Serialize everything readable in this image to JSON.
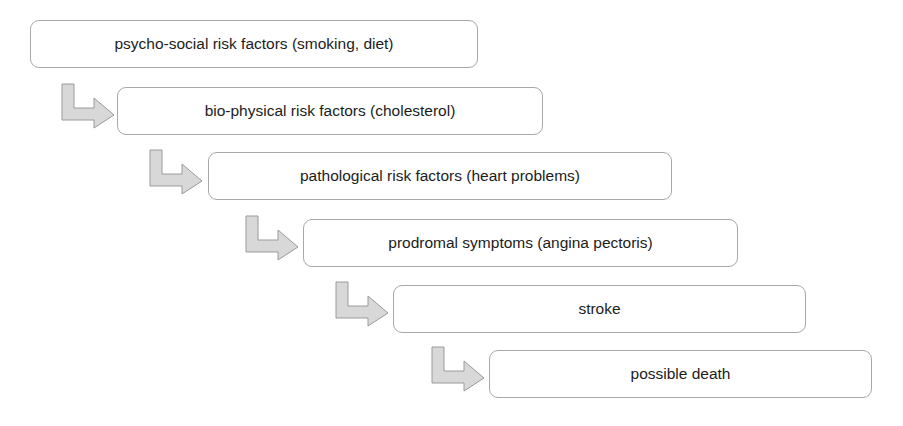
{
  "diagram": {
    "type": "cascading-staircase-flowchart",
    "title": "",
    "background_color": "#ffffff",
    "box_style": {
      "fill": "#ffffff",
      "border_color": "#a8a8a8",
      "text_color": "#1c1c1c",
      "corner_radius": 9
    },
    "arrow_style": {
      "fill": "#d8d8d8",
      "stroke": "#9a9a9a",
      "shape": "elbow-down-right"
    },
    "steps": [
      {
        "index": 1,
        "label": "psycho-social risk factors (smoking, diet)",
        "x": 30,
        "y": 20,
        "width": 448,
        "height": 48
      },
      {
        "index": 2,
        "label": "bio-physical risk factors (cholesterol)",
        "x": 117,
        "y": 87,
        "width": 426,
        "height": 48
      },
      {
        "index": 3,
        "label": "pathological risk factors (heart problems)",
        "x": 208,
        "y": 152,
        "width": 464,
        "height": 48
      },
      {
        "index": 4,
        "label": "prodromal symptoms (angina pectoris)",
        "x": 303,
        "y": 219,
        "width": 435,
        "height": 48
      },
      {
        "index": 5,
        "label": "stroke",
        "x": 393,
        "y": 285,
        "width": 413,
        "height": 48
      },
      {
        "index": 6,
        "label": "possible death",
        "x": 489,
        "y": 350,
        "width": 383,
        "height": 48
      }
    ],
    "connectors": [
      {
        "index": 1,
        "from_step": 1,
        "to_step": 2,
        "x": 60,
        "y": 84,
        "width": 56,
        "height": 44
      },
      {
        "index": 2,
        "from_step": 2,
        "to_step": 3,
        "x": 148,
        "y": 150,
        "width": 56,
        "height": 44
      },
      {
        "index": 3,
        "from_step": 3,
        "to_step": 4,
        "x": 244,
        "y": 216,
        "width": 56,
        "height": 44
      },
      {
        "index": 4,
        "from_step": 4,
        "to_step": 5,
        "x": 334,
        "y": 282,
        "width": 56,
        "height": 44
      },
      {
        "index": 5,
        "from_step": 5,
        "to_step": 6,
        "x": 430,
        "y": 347,
        "width": 56,
        "height": 44
      }
    ]
  }
}
